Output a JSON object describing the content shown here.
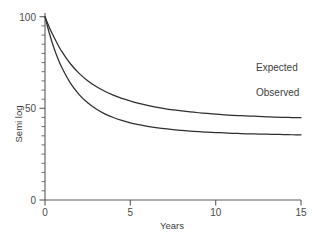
{
  "chart_data": {
    "type": "line",
    "title": "",
    "subtitle": "",
    "xlabel": "Years",
    "ylabel": "Semi log",
    "xlim": [
      0,
      15
    ],
    "ylim": [
      0,
      103
    ],
    "grid": false,
    "legend_position": "inline-right-of-curve-ends",
    "x_ticks": [
      0,
      5,
      10,
      15
    ],
    "x_tick_labels": [
      "0",
      "5",
      "10",
      "15"
    ],
    "y_ticks": [
      0,
      50,
      100
    ],
    "y_tick_labels": [
      "0",
      "50",
      "100"
    ],
    "y_minor_tick_step": 5,
    "annotations": [
      {
        "text": "Expected",
        "series": "Expected"
      },
      {
        "text": "Observed",
        "series": "Observed"
      }
    ],
    "x": [
      0,
      0.25,
      0.5,
      0.75,
      1,
      1.5,
      2,
      2.5,
      3,
      3.5,
      4,
      4.5,
      5,
      5.5,
      6,
      6.5,
      7,
      7.5,
      8,
      8.5,
      9,
      9.5,
      10,
      10.5,
      11,
      11.5,
      12,
      12.5,
      13,
      13.5,
      14,
      14.5,
      15
    ],
    "series": [
      {
        "name": "Expected",
        "color": "#2e2e2e",
        "values": [
          100,
          94.3,
          89.3,
          84.8,
          80.8,
          74.2,
          69.1,
          65.1,
          61.9,
          59.3,
          57.2,
          55.4,
          54.0,
          52.7,
          51.6,
          50.7,
          49.9,
          49.2,
          48.6,
          48.1,
          47.6,
          47.2,
          46.8,
          46.5,
          46.2,
          46.0,
          45.8,
          45.6,
          45.4,
          45.2,
          45.1,
          45.0,
          44.9
        ],
        "asymptote": 44.2
      },
      {
        "name": "Observed",
        "color": "#2e2e2e",
        "values": [
          100,
          91.1,
          83.6,
          77.3,
          72.0,
          63.6,
          57.5,
          53.0,
          49.6,
          47.0,
          45.0,
          43.4,
          42.1,
          41.1,
          40.2,
          39.5,
          38.9,
          38.4,
          38.0,
          37.6,
          37.3,
          37.0,
          36.8,
          36.6,
          36.4,
          36.2,
          36.1,
          36.0,
          35.9,
          35.8,
          35.7,
          35.6,
          35.5
        ],
        "asymptote": 35.1
      }
    ]
  },
  "axes": {
    "y_label": "Semi log",
    "x_label": "Years",
    "y_tick_top": "100",
    "y_tick_mid": "50",
    "y_tick_zero": "0",
    "x_tick_0": "0",
    "x_tick_5": "5",
    "x_tick_10": "10",
    "x_tick_15": "15"
  },
  "labels": {
    "expected": "Expected",
    "observed": "Observed"
  },
  "colors": {
    "curve": "#2e2e2e",
    "axis": "#5a5a5a",
    "text": "#3d3d3d",
    "background": "#ffffff"
  }
}
